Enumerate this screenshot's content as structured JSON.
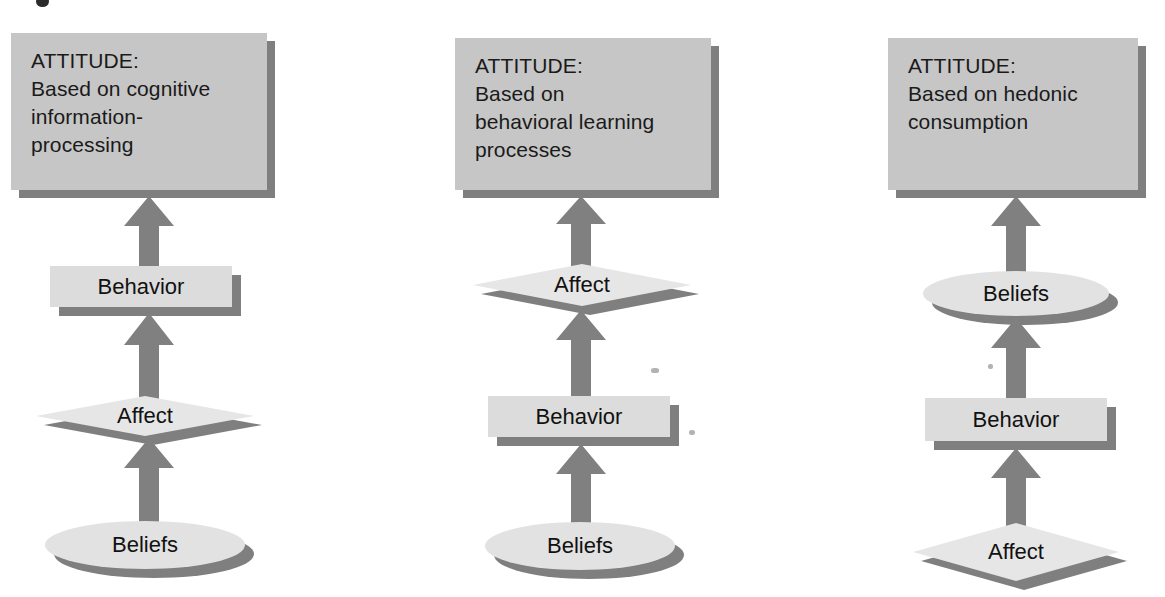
{
  "diagram": {
    "columns": [
      {
        "id": "standard-learning",
        "attitude": {
          "label": "ATTITUDE:\nBased on cognitive\ninformation-\nprocessing"
        },
        "levels": [
          {
            "shape": "rectangle",
            "label": "Behavior"
          },
          {
            "shape": "diamond",
            "label": "Affect"
          },
          {
            "shape": "ellipse",
            "label": "Beliefs"
          }
        ]
      },
      {
        "id": "low-involvement",
        "attitude": {
          "label": "ATTITUDE:\nBased on\nbehavioral learning\nprocesses"
        },
        "levels": [
          {
            "shape": "diamond",
            "label": "Affect"
          },
          {
            "shape": "rectangle",
            "label": "Behavior"
          },
          {
            "shape": "ellipse",
            "label": "Beliefs"
          }
        ]
      },
      {
        "id": "experiential",
        "attitude": {
          "label": "ATTITUDE:\nBased on hedonic\nconsumption"
        },
        "levels": [
          {
            "shape": "ellipse",
            "label": "Beliefs"
          },
          {
            "shape": "rectangle",
            "label": "Behavior"
          },
          {
            "shape": "diamond",
            "label": "Affect"
          }
        ]
      }
    ],
    "arrow_icon": "up-block-arrow-icon",
    "colors": {
      "attitude_box_fill": "#c6c6c6",
      "rect_fill": "#dcdcdc",
      "ellipse_fill": "#e2e2e2",
      "diamond_fill": "#e6e6e6",
      "shadow": "#7f7f7f",
      "arrow": "#808080",
      "text": "#111111",
      "background": "#ffffff"
    }
  }
}
